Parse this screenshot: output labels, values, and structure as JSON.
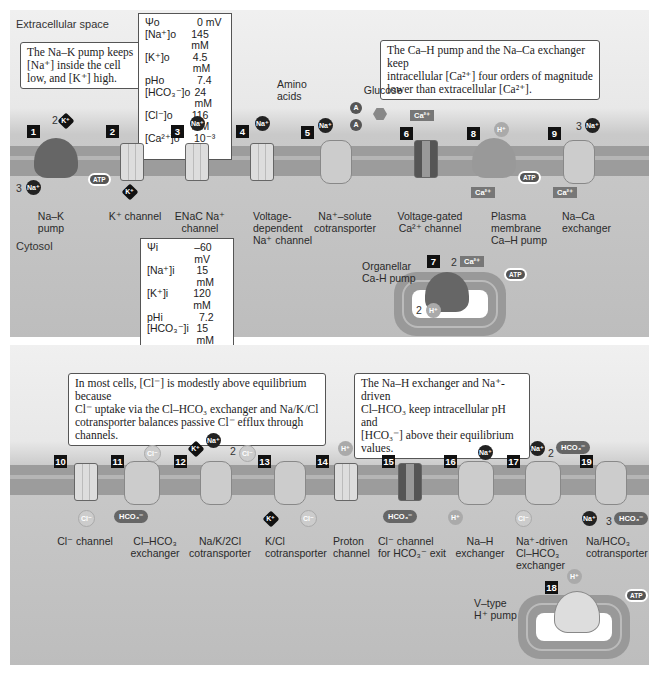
{
  "top_panel": {
    "region_extracellular": "Extracellular space",
    "region_cytosol": "Cytosol",
    "callout_nak": "The Na–K pump keeps\n[Na⁺] inside the cell\nlow, and [K⁺] high.",
    "callout_ca": "The Ca–H pump and the Na–Ca exchanger keep\nintracellular [Ca²⁺] four orders of magnitude\nlower than extracellular [Ca²⁺].",
    "extracellular_conc": [
      {
        "k": "Ψo",
        "v": "0 mV"
      },
      {
        "k": "[Na⁺]o",
        "v": "145 mM"
      },
      {
        "k": "[K⁺]o",
        "v": "4.5 mM"
      },
      {
        "k": "pHo",
        "v": "7.4"
      },
      {
        "k": "[HCO₃⁻]o",
        "v": "24 mM"
      },
      {
        "k": "[Cl⁻]o",
        "v": "116 mM"
      },
      {
        "k": "[Ca²⁺]o",
        "v": "10⁻³ M"
      }
    ],
    "intracellular_conc": [
      {
        "k": "Ψi",
        "v": "–60 mV"
      },
      {
        "k": "[Na⁺]i",
        "v": "15 mM"
      },
      {
        "k": "[K⁺]i",
        "v": "120 mM"
      },
      {
        "k": "pHi",
        "v": "7.2"
      },
      {
        "k": "[HCO₃⁻]i",
        "v": "15 mM"
      },
      {
        "k": "[Cl⁻]i",
        "v": "20 mM"
      },
      {
        "k": "[Ca²⁺]i",
        "v": "10⁻⁷ M"
      }
    ],
    "substrates": {
      "amino_acids": "Amino\nacids",
      "glucose": "Glucose"
    },
    "transporters": [
      {
        "num": "1",
        "label": "Na–K\npump"
      },
      {
        "num": "2",
        "label": "K⁺ channel"
      },
      {
        "num": "3",
        "label": "ENaC Na⁺\nchannel"
      },
      {
        "num": "4",
        "label": "Voltage-\ndependent\nNa⁺ channel"
      },
      {
        "num": "5",
        "label": "Na⁺–solute\ncotransporter"
      },
      {
        "num": "6",
        "label": "Voltage-gated\nCa²⁺ channel"
      },
      {
        "num": "7",
        "label": "Organellar\nCa-H pump"
      },
      {
        "num": "8",
        "label": "Plasma\nmembrane\nCa–H pump"
      },
      {
        "num": "9",
        "label": "Na–Ca\nexchanger"
      }
    ]
  },
  "bottom_panel": {
    "callout_cl": "In most cells, [Cl⁻] is modestly above equilibrium because\nCl⁻ uptake via the Cl–HCO₃ exchanger and Na/K/Cl\ncotransporter balances passive Cl⁻ efflux through channels.",
    "callout_ph": "The Na–H exchanger and Na⁺-driven\nCl–HCO₃ keep intracellular pH and\n[HCO₃⁻] above their equilibrium values.",
    "transporters": [
      {
        "num": "10",
        "label": "Cl⁻ channel"
      },
      {
        "num": "11",
        "label": "Cl–HCO₃\nexchanger"
      },
      {
        "num": "12",
        "label": "Na/K/2Cl\ncotransporter"
      },
      {
        "num": "13",
        "label": "K/Cl\ncotransporter"
      },
      {
        "num": "14",
        "label": "Proton\nchannel"
      },
      {
        "num": "15",
        "label": "Cl⁻ channel\nfor HCO₃⁻ exit"
      },
      {
        "num": "16",
        "label": "Na–H\nexchanger"
      },
      {
        "num": "17",
        "label": "Na⁺-driven\nCl–HCO₃\nexchanger"
      },
      {
        "num": "18",
        "label": "V–type\nH⁺ pump"
      },
      {
        "num": "19",
        "label": "Na/HCO₃\ncotransporter"
      }
    ]
  },
  "ions": {
    "na": "Na⁺",
    "k": "K⁺",
    "cl": "Cl⁻",
    "h": "H⁺",
    "ca": "Ca²⁺",
    "hco3": "HCO₃⁻",
    "a": "A",
    "atp": "ATP"
  },
  "coefficients": {
    "two": "2",
    "three": "3"
  },
  "colors": {
    "membrane": "#9c9c9c",
    "background_top": "#f0f0f0",
    "background_cytosol": "#bdbdbd",
    "number_badge": "#111111"
  }
}
